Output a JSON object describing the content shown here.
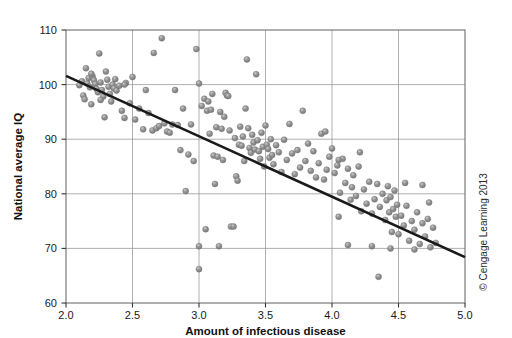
{
  "figure": {
    "credit": "© Cengage Learning 2013",
    "background_color": "#ffffff"
  },
  "chart_data": {
    "type": "scatter",
    "title": "",
    "xlabel": "Amount of infectious disease",
    "ylabel": "National average IQ",
    "xlim": [
      2.0,
      5.0
    ],
    "ylim": [
      60,
      110
    ],
    "xticks": [
      2.0,
      2.5,
      3.0,
      3.5,
      4.0,
      4.5,
      5.0
    ],
    "xtick_labels": [
      "2.0",
      "2.5",
      "3.0",
      "3.5",
      "4.0",
      "4.5",
      "5.0"
    ],
    "yticks": [
      60,
      70,
      80,
      90,
      100,
      110
    ],
    "ytick_labels": [
      "60",
      "70",
      "80",
      "90",
      "100",
      "110"
    ],
    "grid": true,
    "grid_color": "#9a9a9a",
    "legend": false,
    "marker_color": "#8b8b8b",
    "marker_edge_color": "#6f6f6f",
    "marker_size": 5.6,
    "trendline": {
      "type": "linear",
      "color": "#1a1a1a",
      "width": 2.6,
      "x": [
        2.0,
        5.0
      ],
      "y": [
        101.6,
        68.4
      ],
      "slope": -11.07,
      "intercept": 123.7
    },
    "points": [
      [
        2.1,
        99.9
      ],
      [
        2.12,
        100.6
      ],
      [
        2.13,
        98.0
      ],
      [
        2.14,
        97.3
      ],
      [
        2.15,
        103.0
      ],
      [
        2.16,
        100.2
      ],
      [
        2.17,
        101.2
      ],
      [
        2.18,
        99.5
      ],
      [
        2.19,
        96.4
      ],
      [
        2.2,
        101.5
      ],
      [
        2.21,
        100.8
      ],
      [
        2.22,
        100.1
      ],
      [
        2.23,
        99.2
      ],
      [
        2.24,
        98.6
      ],
      [
        2.25,
        105.7
      ],
      [
        2.26,
        100.4
      ],
      [
        2.27,
        99.0
      ],
      [
        2.28,
        97.8
      ],
      [
        2.29,
        94.0
      ],
      [
        2.3,
        102.4
      ],
      [
        2.31,
        100.9
      ],
      [
        2.32,
        99.6
      ],
      [
        2.33,
        98.3
      ],
      [
        2.34,
        96.9
      ],
      [
        2.35,
        100.0
      ],
      [
        2.36,
        99.3
      ],
      [
        2.37,
        101.0
      ],
      [
        2.38,
        98.9
      ],
      [
        2.4,
        99.8
      ],
      [
        2.42,
        95.2
      ],
      [
        2.44,
        93.9
      ],
      [
        2.45,
        100.3
      ],
      [
        2.48,
        96.6
      ],
      [
        2.5,
        101.4
      ],
      [
        2.52,
        93.6
      ],
      [
        2.55,
        95.6
      ],
      [
        2.58,
        91.8
      ],
      [
        2.6,
        99.0
      ],
      [
        2.62,
        94.8
      ],
      [
        2.65,
        91.6
      ],
      [
        2.66,
        105.8
      ],
      [
        2.68,
        92.0
      ],
      [
        2.7,
        92.4
      ],
      [
        2.72,
        108.5
      ],
      [
        2.74,
        92.9
      ],
      [
        2.76,
        91.4
      ],
      [
        2.78,
        91.2
      ],
      [
        2.8,
        92.7
      ],
      [
        2.82,
        99.0
      ],
      [
        2.84,
        92.6
      ],
      [
        2.86,
        88.0
      ],
      [
        2.88,
        95.6
      ],
      [
        2.9,
        80.5
      ],
      [
        2.92,
        87.2
      ],
      [
        2.94,
        92.7
      ],
      [
        2.96,
        86.0
      ],
      [
        2.98,
        106.5
      ],
      [
        3.0,
        100.2
      ],
      [
        3.0,
        70.4
      ],
      [
        3.0,
        66.2
      ],
      [
        3.02,
        96.1
      ],
      [
        3.04,
        97.4
      ],
      [
        3.05,
        73.5
      ],
      [
        3.06,
        95.2
      ],
      [
        3.07,
        96.9
      ],
      [
        3.08,
        91.0
      ],
      [
        3.09,
        95.4
      ],
      [
        3.1,
        98.3
      ],
      [
        3.11,
        87.0
      ],
      [
        3.12,
        81.8
      ],
      [
        3.13,
        92.2
      ],
      [
        3.14,
        86.8
      ],
      [
        3.15,
        70.4
      ],
      [
        3.16,
        95.0
      ],
      [
        3.17,
        91.9
      ],
      [
        3.18,
        86.2
      ],
      [
        3.19,
        94.1
      ],
      [
        3.2,
        98.5
      ],
      [
        3.21,
        98.0
      ],
      [
        3.22,
        97.9
      ],
      [
        3.23,
        91.6
      ],
      [
        3.24,
        74.0
      ],
      [
        3.26,
        74.0
      ],
      [
        3.27,
        90.2
      ],
      [
        3.28,
        83.2
      ],
      [
        3.29,
        82.4
      ],
      [
        3.3,
        89.0
      ],
      [
        3.31,
        92.3
      ],
      [
        3.32,
        88.8
      ],
      [
        3.33,
        90.5
      ],
      [
        3.34,
        86.0
      ],
      [
        3.35,
        95.6
      ],
      [
        3.36,
        104.6
      ],
      [
        3.37,
        92.0
      ],
      [
        3.38,
        88.4
      ],
      [
        3.39,
        87.5
      ],
      [
        3.4,
        90.8
      ],
      [
        3.41,
        89.4
      ],
      [
        3.42,
        88.1
      ],
      [
        3.43,
        101.9
      ],
      [
        3.44,
        89.8
      ],
      [
        3.45,
        87.8
      ],
      [
        3.46,
        86.4
      ],
      [
        3.47,
        91.2
      ],
      [
        3.48,
        88.6
      ],
      [
        3.49,
        85.0
      ],
      [
        3.5,
        92.5
      ],
      [
        3.51,
        89.0
      ],
      [
        3.52,
        88.2
      ],
      [
        3.53,
        86.6
      ],
      [
        3.54,
        90.0
      ],
      [
        3.55,
        87.1
      ],
      [
        3.56,
        85.4
      ],
      [
        3.58,
        88.9
      ],
      [
        3.6,
        87.6
      ],
      [
        3.62,
        84.0
      ],
      [
        3.64,
        89.9
      ],
      [
        3.66,
        86.2
      ],
      [
        3.68,
        92.8
      ],
      [
        3.7,
        87.4
      ],
      [
        3.72,
        83.6
      ],
      [
        3.74,
        88.0
      ],
      [
        3.76,
        84.8
      ],
      [
        3.78,
        95.2
      ],
      [
        3.8,
        86.0
      ],
      [
        3.82,
        89.2
      ],
      [
        3.84,
        84.2
      ],
      [
        3.86,
        87.8
      ],
      [
        3.88,
        83.0
      ],
      [
        3.9,
        85.6
      ],
      [
        3.92,
        91.0
      ],
      [
        3.94,
        82.6
      ],
      [
        3.96,
        84.4
      ],
      [
        3.98,
        86.8
      ],
      [
        4.0,
        88.3
      ],
      [
        4.02,
        83.8
      ],
      [
        4.04,
        85.2
      ],
      [
        4.06,
        80.2
      ],
      [
        4.08,
        86.4
      ],
      [
        4.1,
        82.0
      ],
      [
        4.12,
        84.6
      ],
      [
        4.14,
        78.9
      ],
      [
        4.15,
        81.2
      ],
      [
        4.16,
        83.4
      ],
      [
        4.18,
        79.6
      ],
      [
        4.2,
        85.0
      ],
      [
        4.22,
        76.8
      ],
      [
        4.24,
        80.8
      ],
      [
        4.26,
        78.2
      ],
      [
        4.28,
        82.2
      ],
      [
        4.3,
        76.4
      ],
      [
        4.32,
        79.0
      ],
      [
        4.34,
        81.8
      ],
      [
        4.36,
        77.6
      ],
      [
        4.38,
        80.0
      ],
      [
        4.4,
        75.2
      ],
      [
        4.41,
        78.8
      ],
      [
        4.42,
        81.4
      ],
      [
        4.43,
        76.6
      ],
      [
        4.44,
        79.4
      ],
      [
        4.45,
        73.0
      ],
      [
        4.46,
        77.2
      ],
      [
        4.47,
        80.6
      ],
      [
        4.48,
        75.8
      ],
      [
        4.49,
        78.0
      ],
      [
        4.5,
        72.6
      ],
      [
        4.52,
        76.0
      ],
      [
        4.54,
        74.2
      ],
      [
        4.56,
        77.8
      ],
      [
        4.58,
        71.4
      ],
      [
        4.6,
        75.0
      ],
      [
        4.62,
        73.4
      ],
      [
        4.64,
        76.6
      ],
      [
        4.66,
        70.8
      ],
      [
        4.68,
        74.6
      ],
      [
        4.7,
        72.2
      ],
      [
        4.72,
        75.4
      ],
      [
        4.74,
        70.2
      ],
      [
        4.76,
        73.8
      ],
      [
        4.78,
        71.0
      ],
      [
        4.35,
        64.8
      ],
      [
        4.21,
        87.6
      ],
      [
        3.95,
        91.4
      ],
      [
        2.44,
        100.0
      ],
      [
        2.26,
        97.2
      ],
      [
        2.19,
        102.0
      ],
      [
        4.12,
        70.6
      ],
      [
        4.3,
        70.4
      ],
      [
        4.44,
        70.0
      ],
      [
        4.62,
        69.8
      ],
      [
        4.05,
        75.8
      ],
      [
        4.55,
        82.0
      ],
      [
        4.68,
        81.6
      ],
      [
        4.73,
        78.4
      ],
      [
        4.05,
        86.2
      ]
    ]
  }
}
